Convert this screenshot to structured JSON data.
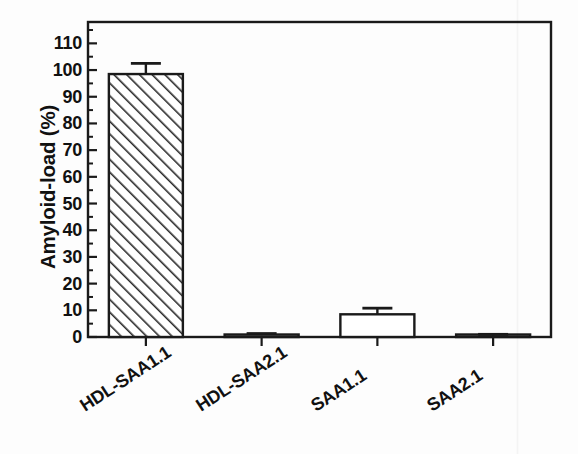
{
  "chart_data": {
    "type": "bar",
    "title": "",
    "subtitle": "",
    "xlabel": "",
    "ylabel": "Amyloid-load (%)",
    "categories": [
      "HDL-SAA1.1",
      "HDL-SAA2.1",
      "SAA1.1",
      "SAA2.1"
    ],
    "values": [
      98.5,
      0.7,
      8.5,
      0.5
    ],
    "errors": [
      4.0,
      0.6,
      2.3,
      0.5
    ],
    "series": [
      {
        "name": "Amyloid-load",
        "values": [
          98.5,
          0.7,
          8.5,
          0.5
        ],
        "errors": [
          4.0,
          0.6,
          2.3,
          0.5
        ],
        "fills": [
          "diagonal-hatch",
          "none",
          "none",
          "none"
        ]
      }
    ],
    "ylim": [
      0,
      118
    ],
    "ytick_values": [
      0,
      10,
      20,
      30,
      40,
      50,
      60,
      70,
      80,
      90,
      100,
      110
    ],
    "ytick_labels": [
      "0",
      "10",
      "20",
      "30",
      "40",
      "50",
      "60",
      "70",
      "80",
      "90",
      "100",
      "110"
    ],
    "minor_ticks": true,
    "grid": false,
    "legend": false,
    "legend_position": "none",
    "xtick_rotation_deg": -33,
    "bar_edge_color": "#1a1a1a",
    "bar_fill_color": "#ffffff",
    "hatch_color": "#2a2a2a",
    "axis_color": "#1a1a1a",
    "background_color": "#ffffff",
    "plot_box": {
      "left": 88,
      "right": 551,
      "top": 22,
      "bottom": 337,
      "border": "full-box"
    }
  },
  "figure": {
    "y_axis_title": "Amyloid-load (%)",
    "tick_labels": {
      "y": [
        "110",
        "100",
        "90",
        "80",
        "70",
        "60",
        "50",
        "40",
        "30",
        "20",
        "10",
        "0"
      ],
      "x": [
        "HDL-SAA1.1",
        "HDL-SAA2.1",
        "SAA1.1",
        "SAA2.1"
      ]
    }
  }
}
